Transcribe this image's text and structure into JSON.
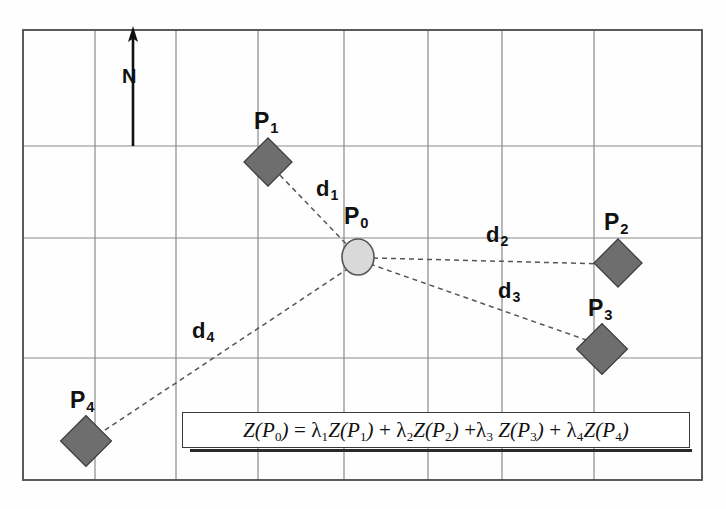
{
  "figure": {
    "type": "spatial-interpolation-diagram",
    "background_color": "#ffffff",
    "grid": {
      "border_color": "#4a4a4a",
      "line_color": "#7a7a7a",
      "x_lines": [
        23,
        95,
        176,
        258,
        344,
        428,
        502
      ],
      "y_lines": [
        30,
        146,
        238,
        358,
        480
      ],
      "columns": 6,
      "rows": 4
    },
    "north_arrow": {
      "label": "N",
      "x": 133,
      "y_top": 30,
      "y_bottom": 146,
      "color": "#111111"
    },
    "markers": {
      "estimation_point": {
        "id": "P0",
        "label": "P",
        "sub": "0",
        "shape": "ellipse",
        "fill": "#d9d9d9",
        "stroke": "#555555",
        "cx": 358,
        "cy": 257,
        "rx": 16,
        "ry": 18,
        "label_x": 344,
        "label_y": 205
      },
      "samples": [
        {
          "id": "P1",
          "label": "P",
          "sub": "1",
          "shape": "diamond",
          "fill": "#6e6e6e",
          "stroke": "#3a3a3a",
          "cx": 268,
          "cy": 162,
          "size": 34,
          "label_x": 254,
          "label_y": 110
        },
        {
          "id": "P2",
          "label": "P",
          "sub": "2",
          "shape": "diamond",
          "fill": "#6e6e6e",
          "stroke": "#3a3a3a",
          "cx": 618,
          "cy": 263,
          "size": 34,
          "label_x": 604,
          "label_y": 211
        },
        {
          "id": "P3",
          "label": "P",
          "sub": "3",
          "shape": "diamond",
          "fill": "#6e6e6e",
          "stroke": "#3a3a3a",
          "cx": 602,
          "cy": 349,
          "size": 36,
          "label_x": 588,
          "label_y": 297
        },
        {
          "id": "P4",
          "label": "P",
          "sub": "4",
          "shape": "diamond",
          "fill": "#6e6e6e",
          "stroke": "#3a3a3a",
          "cx": 86,
          "cy": 441,
          "size": 36,
          "label_x": 70,
          "label_y": 389
        }
      ]
    },
    "distance_lines": [
      {
        "id": "d1",
        "label": "d",
        "sub": "1",
        "from": "P0",
        "to": "P1",
        "x1": 358,
        "y1": 257,
        "x2": 275,
        "y2": 170,
        "style": "dashed",
        "color": "#555555",
        "label_x": 316,
        "label_y": 178
      },
      {
        "id": "d2",
        "label": "d",
        "sub": "2",
        "from": "P0",
        "to": "P2",
        "x1": 358,
        "y1": 257,
        "x2": 606,
        "y2": 263,
        "style": "dashed",
        "color": "#555555",
        "label_x": 486,
        "label_y": 224
      },
      {
        "id": "d3",
        "label": "d",
        "sub": "3",
        "from": "P0",
        "to": "P3",
        "x1": 358,
        "y1": 257,
        "x2": 592,
        "y2": 341,
        "style": "dashed",
        "color": "#555555",
        "label_x": 498,
        "label_y": 280
      },
      {
        "id": "d4",
        "label": "d",
        "sub": "4",
        "from": "P0",
        "to": "P4",
        "x1": 358,
        "y1": 257,
        "x2": 98,
        "y2": 434,
        "style": "dashed",
        "color": "#555555",
        "label_x": 192,
        "label_y": 320
      }
    ],
    "formula": {
      "text": "Z(P0) = λ1Z(P1) + λ2Z(P2) + λ3 Z(P3) + λ4Z(P4)",
      "box_border_color": "#3a3a3a",
      "box_fill": "#ffffff"
    }
  }
}
